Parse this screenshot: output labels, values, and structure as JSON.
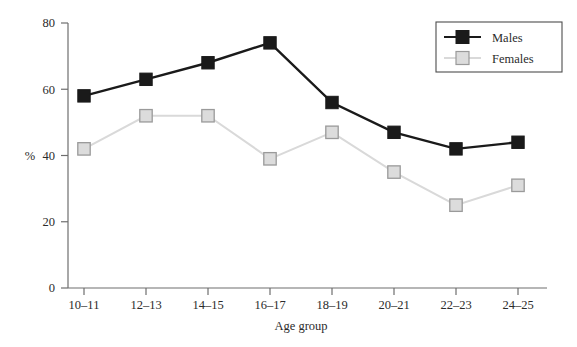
{
  "chart_data": {
    "type": "line",
    "title": "",
    "subtitle": "",
    "xlabel": "Age group",
    "ylabel": "%",
    "categories": [
      "10–11",
      "12–13",
      "14–15",
      "16–17",
      "18–19",
      "20–21",
      "22–23",
      "24–25"
    ],
    "series": [
      {
        "name": "Males",
        "values": [
          58,
          63,
          68,
          74,
          56,
          47,
          42,
          44
        ],
        "color": "#1a1a1a",
        "marker": "filled-square"
      },
      {
        "name": "Females",
        "values": [
          42,
          52,
          52,
          39,
          47,
          35,
          25,
          31
        ],
        "color": "#d9d9d9",
        "marker": "open-square"
      }
    ],
    "ylim": [
      0,
      80
    ],
    "yticks": [
      0,
      20,
      40,
      60,
      80
    ],
    "ytick_labels": [
      "0",
      "20",
      "40",
      "60",
      "80"
    ],
    "grid": false,
    "legend_position": "top-right"
  },
  "legend": {
    "entries": [
      {
        "label": "Males"
      },
      {
        "label": "Females"
      }
    ]
  },
  "axes": {
    "y_label": "%",
    "x_label": "Age group"
  }
}
